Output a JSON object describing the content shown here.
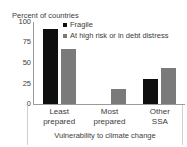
{
  "clipped_title_remnant": "",
  "chart_data": {
    "type": "bar",
    "title": "",
    "ylabel": "Percent of countries",
    "xlabel": "Vulnerability to climate change",
    "categories": [
      "Least prepared",
      "Most prepared",
      "Other SSA"
    ],
    "category_lines": [
      [
        "Least",
        "prepared"
      ],
      [
        "Most",
        "prepared"
      ],
      [
        "Other",
        "SSA"
      ]
    ],
    "series": [
      {
        "name": "Fragile",
        "color": "#0f0f0f",
        "values": [
          91,
          0,
          31
        ]
      },
      {
        "name": "At high risk or in debt distress",
        "color": "#7a7a7a",
        "values": [
          67,
          18,
          44
        ]
      }
    ],
    "ylim": [
      0,
      100
    ],
    "yticks": [
      100,
      75,
      50,
      25,
      0
    ],
    "grid": false,
    "legend_position": "top-right"
  }
}
